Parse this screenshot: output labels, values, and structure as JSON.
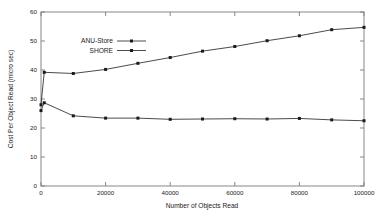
{
  "chart_data": {
    "type": "line",
    "title": "",
    "xlabel": "Number of Objects Read",
    "ylabel": "Cost Per Object Read (micro sec)",
    "xlim": [
      0,
      100000
    ],
    "ylim": [
      0,
      60
    ],
    "xticks": [
      0,
      20000,
      40000,
      60000,
      80000,
      100000
    ],
    "xtick_labels": [
      "0",
      "20000",
      "40000",
      "60000",
      "80000",
      "100000"
    ],
    "yticks": [
      0,
      10,
      20,
      30,
      40,
      50,
      60
    ],
    "ytick_labels": [
      "0",
      "10",
      "20",
      "30",
      "40",
      "50",
      "60"
    ],
    "grid": false,
    "legend_position": "upper left inside",
    "series": [
      {
        "name": "ANU-Store",
        "marker": "filled-square",
        "color": "#1a1a1a",
        "x": [
          0,
          1000,
          10000,
          20000,
          30000,
          40000,
          50000,
          60000,
          70000,
          80000,
          90000,
          100000
        ],
        "values": [
          26.0,
          28.7,
          24.2,
          23.4,
          23.4,
          23.0,
          23.1,
          23.2,
          23.1,
          23.3,
          22.8,
          22.5
        ]
      },
      {
        "name": "SHORE",
        "marker": "filled-square",
        "color": "#1a1a1a",
        "x": [
          0,
          1000,
          10000,
          20000,
          30000,
          40000,
          50000,
          60000,
          70000,
          80000,
          90000,
          100000
        ],
        "values": [
          28.0,
          39.2,
          38.8,
          40.2,
          42.3,
          44.3,
          46.5,
          48.1,
          50.1,
          51.8,
          53.9,
          54.7
        ]
      }
    ]
  },
  "legend": {
    "entries": [
      {
        "label": "ANU-Store"
      },
      {
        "label": "SHORE"
      }
    ]
  },
  "axes": {
    "x_title": "Number of Objects Read",
    "y_title": "Cost Per Object Read (micro sec)"
  }
}
